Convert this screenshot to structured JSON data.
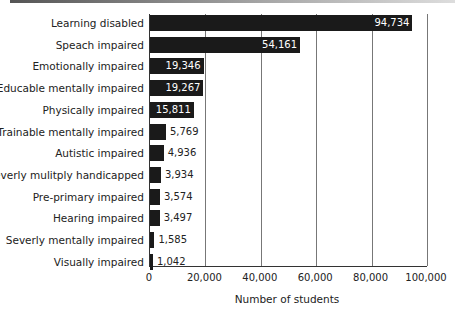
{
  "chart_data": {
    "type": "bar",
    "orientation": "horizontal",
    "title": "",
    "xlabel": "Number of students",
    "ylabel": "",
    "xlim": [
      0,
      100000
    ],
    "xticks": [
      "0",
      "20,000",
      "40,000",
      "60,000",
      "80,000",
      "100,000"
    ],
    "grid": "vertical",
    "legend": "none",
    "categories": [
      "Learning disabled",
      "Speach impaired",
      "Emotionally impaired",
      "Educable mentally impaired",
      "Physically impaired",
      "Trainable mentally impaired",
      "Autistic impaired",
      "Severly mulitply handicapped",
      "Pre-primary impaired",
      "Hearing impaired",
      "Severly mentally impaired",
      "Visually impaired"
    ],
    "values": [
      94734,
      54161,
      19346,
      19267,
      15811,
      5769,
      4936,
      3934,
      3574,
      3497,
      1585,
      1042
    ],
    "value_labels": [
      "94,734",
      "54,161",
      "19,346",
      "19,267",
      "15,811",
      "5,769",
      "4,936",
      "3,934",
      "3,574",
      "3,497",
      "1,585",
      "1,042"
    ]
  },
  "colors": {
    "bar": "#1a1a1a",
    "grid": "#777777"
  }
}
